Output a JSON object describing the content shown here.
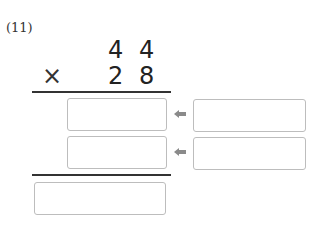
{
  "problem": {
    "label": "(11)",
    "multiplicand": [
      "4",
      "4"
    ],
    "operator": "×",
    "multiplier": [
      "2",
      "8"
    ]
  },
  "answer_boxes": {
    "partial_products": [
      "",
      ""
    ],
    "helper_boxes": [
      "",
      ""
    ],
    "final_product": ""
  },
  "icons": {
    "arrow": "left-arrow-icon"
  },
  "colors": {
    "box_border": "#bdbdbd",
    "arrow": "#8a8a8a",
    "line": "#333333"
  }
}
